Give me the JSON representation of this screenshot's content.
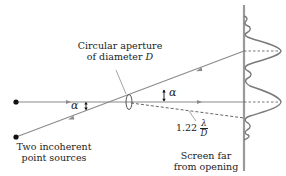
{
  "diagram": {
    "labels": {
      "aperture_line1": "Circular aperture",
      "aperture_line2": "of diameter",
      "aperture_symbol": "D",
      "sources_line1": "Two incoherent",
      "sources_line2": "point sources",
      "screen_line1": "Screen far",
      "screen_line2": "from opening",
      "angle_left": "α",
      "angle_right": "α",
      "resolution_coeff": "1.22",
      "resolution_num": "λ",
      "resolution_den": "D"
    },
    "colors": {
      "ray": "#8a8a8a",
      "screen": "#9a9a9a",
      "pattern": "#7a7a7a",
      "dot": "#111111",
      "text": "#222222"
    },
    "elements": {
      "sources": [
        {
          "name": "source-top",
          "x": 16,
          "y": 102
        },
        {
          "name": "source-bottom",
          "x": 16,
          "y": 137
        }
      ],
      "aperture": {
        "x": 129,
        "y": 102
      },
      "screen_x": 244,
      "peaks_y": [
        51,
        102
      ],
      "dashed_ray_end_y": 118
    }
  }
}
